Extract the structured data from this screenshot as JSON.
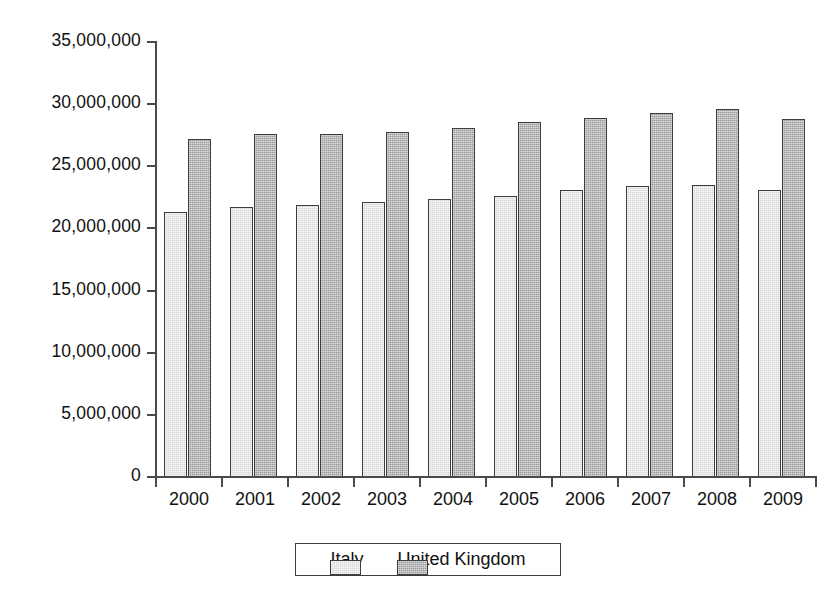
{
  "chart_data": {
    "type": "bar",
    "title": "",
    "subtitle": "",
    "xlabel": "",
    "ylabel": "",
    "categories": [
      "2000",
      "2001",
      "2002",
      "2003",
      "2004",
      "2005",
      "2006",
      "2007",
      "2008",
      "2009"
    ],
    "series": [
      {
        "name": "Italy",
        "color": "#d6d6d6",
        "values": [
          21300000,
          21700000,
          21900000,
          22100000,
          22400000,
          22600000,
          23100000,
          23400000,
          23500000,
          23100000
        ]
      },
      {
        "name": "United Kingdom",
        "color": "#9a9a9a",
        "values": [
          27200000,
          27600000,
          27600000,
          27800000,
          28100000,
          28600000,
          28900000,
          29250000,
          29600000,
          28800000
        ]
      }
    ],
    "ylim": [
      0,
      35000000
    ],
    "ytick_values": [
      0,
      5000000,
      10000000,
      15000000,
      20000000,
      25000000,
      30000000,
      35000000
    ],
    "ytick_labels": [
      "0",
      "5,000,000",
      "10,000,000",
      "15,000,000",
      "20,000,000",
      "25,000,000",
      "30,000,000",
      "35,000,000"
    ],
    "grid": false,
    "legend_position": "bottom-center",
    "legend_entries": [
      "Italy",
      "United Kingdom"
    ]
  }
}
